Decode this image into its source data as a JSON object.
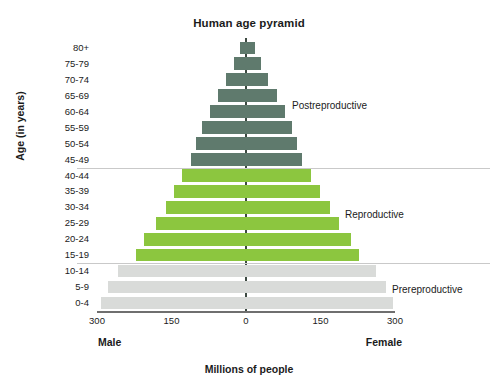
{
  "chart_data": {
    "type": "bar",
    "title": "Human age pyramid",
    "xlabel": "Millions of people",
    "ylabel": "Age (in years)",
    "orientation": "population-pyramid",
    "grid": false,
    "legend_position": "right-inline-annotations",
    "xlim": [
      -300,
      300
    ],
    "xticks": [
      {
        "label": "300",
        "value": -300
      },
      {
        "label": "150",
        "value": -150
      },
      {
        "label": "0",
        "value": 0
      },
      {
        "label": "150",
        "value": 150
      },
      {
        "label": "300",
        "value": 300
      }
    ],
    "axis_max": 300,
    "side_labels": {
      "left": "Male",
      "right": "Female"
    },
    "categories": [
      "80+",
      "75-79",
      "70-74",
      "65-69",
      "60-64",
      "55-59",
      "50-54",
      "45-49",
      "40-44",
      "35-39",
      "30-34",
      "25-29",
      "20-24",
      "15-19",
      "10-14",
      "5-9",
      "0-4"
    ],
    "series": [
      {
        "name": "Male",
        "values": [
          12,
          25,
          40,
          57,
          72,
          88,
          100,
          110,
          128,
          145,
          162,
          182,
          205,
          222,
          258,
          278,
          292
        ]
      },
      {
        "name": "Female",
        "values": [
          18,
          30,
          45,
          62,
          78,
          92,
          102,
          112,
          130,
          148,
          170,
          188,
          212,
          228,
          262,
          282,
          295
        ]
      }
    ],
    "groups": [
      {
        "key": "postreproductive",
        "label": "Postreproductive",
        "color": "#5f7a6d",
        "categories": [
          "80+",
          "75-79",
          "70-74",
          "65-69",
          "60-64",
          "55-59",
          "50-54",
          "45-49"
        ]
      },
      {
        "key": "reproductive",
        "label": "Reproductive",
        "color": "#8cc63f",
        "categories": [
          "40-44",
          "35-39",
          "30-34",
          "25-29",
          "20-24",
          "15-19"
        ]
      },
      {
        "key": "prereproductive",
        "label": "Prereproductive",
        "color": "#d9dbd9",
        "categories": [
          "10-14",
          "5-9",
          "0-4"
        ]
      }
    ],
    "annotations": [
      {
        "text": "Postreproductive",
        "group": "postreproductive"
      },
      {
        "text": "Reproductive",
        "group": "reproductive"
      },
      {
        "text": "Prereproductive",
        "group": "prereproductive"
      }
    ]
  },
  "colors": {
    "postreproductive": "#5f7a6d",
    "reproductive": "#8cc63f",
    "prereproductive": "#d9dbd9",
    "axis": "#6f6f6f",
    "center_line": "#3d4a42",
    "divider": "#c9c9c9",
    "text": "#1b1b1b",
    "background": "#ffffff"
  }
}
